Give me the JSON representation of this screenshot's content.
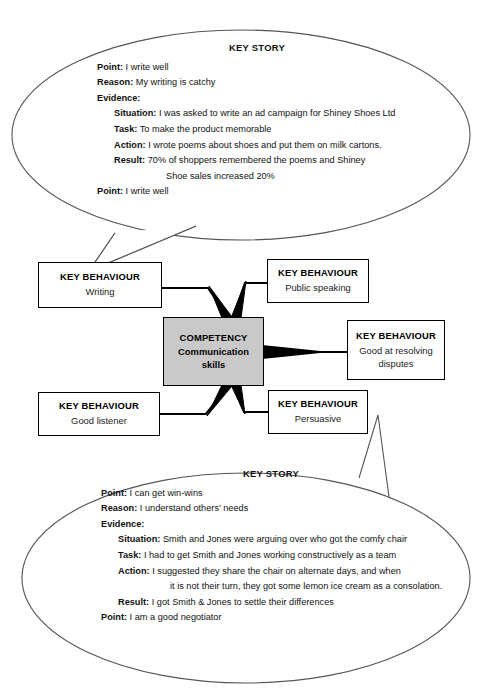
{
  "diagram": {
    "title_label": "KEY STORY",
    "competency": {
      "kind": "COMPETENCY",
      "value": "Communication skills",
      "value_line1": "Communication",
      "value_line2": "skills",
      "fill_color": "#c9c9c9",
      "border_color": "#000000"
    },
    "behaviours": [
      {
        "kind": "KEY BEHAVIOUR",
        "value": "Writing"
      },
      {
        "kind": "KEY BEHAVIOUR",
        "value": "Public speaking"
      },
      {
        "kind": "KEY BEHAVIOUR",
        "value": "Good at resolving disputes",
        "value_line1": "Good at resolving",
        "value_line2": "disputes"
      },
      {
        "kind": "KEY BEHAVIOUR",
        "value": "Good listener"
      },
      {
        "kind": "KEY BEHAVIOUR",
        "value": "Persuasive"
      }
    ],
    "stories": [
      {
        "title": "KEY STORY",
        "lines": [
          {
            "label": "Point:",
            "text": "I write well",
            "indent": 0
          },
          {
            "label": "Reason:",
            "text": "My writing is catchy",
            "indent": 0
          },
          {
            "label": "Evidence:",
            "text": "",
            "indent": 0
          },
          {
            "label": "Situation:",
            "text": "I was asked to write an ad campaign for Shiney Shoes Ltd",
            "indent": 1
          },
          {
            "label": "Task:",
            "text": "To make the product memorable",
            "indent": 1
          },
          {
            "label": "Action:",
            "text": "I wrote poems about shoes and put them on milk cartons.",
            "indent": 1
          },
          {
            "label": "Result:",
            "text": "70% of shoppers remembered the poems and Shiney",
            "indent": 1
          },
          {
            "label": "",
            "text": "Shoe sales increased 20%",
            "indent": 2
          },
          {
            "label": "Point:",
            "text": "I write well",
            "indent": 0
          }
        ]
      },
      {
        "title": "KEY STORY",
        "lines": [
          {
            "label": "Point:",
            "text": "I can get win-wins",
            "indent": 0
          },
          {
            "label": "Reason:",
            "text": "I understand others’ needs",
            "indent": 0
          },
          {
            "label": "Evidence:",
            "text": "",
            "indent": 0
          },
          {
            "label": "Situation:",
            "text": "Smith and Jones were arguing over who got the comfy chair",
            "indent": 1
          },
          {
            "label": "Task:",
            "text": "I had to get Smith and Jones working constructively as a team",
            "indent": 1
          },
          {
            "label": "Action:",
            "text": "I suggested they share the chair on alternate days, and when",
            "indent": 1
          },
          {
            "label": "",
            "text": "it is not their turn, they got some lemon ice cream as a consolation.",
            "indent": 2
          },
          {
            "label": "Result:",
            "text": "I got Smith & Jones to settle their differences",
            "indent": 1
          },
          {
            "label": "Point:",
            "text": "I am a good negotiator",
            "indent": 0
          }
        ]
      }
    ]
  },
  "story_top": {
    "title": "KEY STORY",
    "l0_label": "Point:",
    "l0_text": "I write well",
    "l1_label": "Reason:",
    "l1_text": "My writing is catchy",
    "l2_label": "Evidence:",
    "l2_text": "",
    "l3_label": "Situation:",
    "l3_text": "I was asked to write an ad campaign for Shiney Shoes Ltd",
    "l4_label": "Task:",
    "l4_text": "To make the product memorable",
    "l5_label": "Action:",
    "l5_text": "I wrote poems about shoes and put them on milk cartons.",
    "l6_label": "Result:",
    "l6_text": "70% of shoppers remembered the poems and Shiney",
    "l7_label": "",
    "l7_text": "Shoe sales increased 20%",
    "l8_label": "Point:",
    "l8_text": "I write well"
  },
  "story_bottom": {
    "title": "KEY STORY",
    "l0_label": "Point:",
    "l0_text": "I can get win-wins",
    "l1_label": "Reason:",
    "l1_text": "I understand others’ needs",
    "l2_label": "Evidence:",
    "l2_text": "",
    "l3_label": "Situation:",
    "l3_text": "Smith and Jones were arguing over who got the comfy chair",
    "l4_label": "Task:",
    "l4_text": "I had to get Smith and Jones working constructively as a team",
    "l5_label": "Action:",
    "l5_text": "I suggested they share the chair on alternate days, and when",
    "l6_label": "",
    "l6_text": "it is not their turn, they got some lemon ice cream as a consolation.",
    "l7_label": "Result:",
    "l7_text": "I got Smith & Jones to settle their differences",
    "l8_label": "Point:",
    "l8_text": "I am a good negotiator"
  },
  "nodes": {
    "competency_kind": "COMPETENCY",
    "competency_line1": "Communication",
    "competency_line2": "skills",
    "b1_kind": "KEY BEHAVIOUR",
    "b1_value": "Writing",
    "b2_kind": "KEY BEHAVIOUR",
    "b2_value": "Public speaking",
    "b3_kind": "KEY BEHAVIOUR",
    "b3_line1": "Good at resolving",
    "b3_line2": "disputes",
    "b4_kind": "KEY BEHAVIOUR",
    "b4_value": "Good listener",
    "b5_kind": "KEY BEHAVIOUR",
    "b5_value": "Persuasive"
  }
}
